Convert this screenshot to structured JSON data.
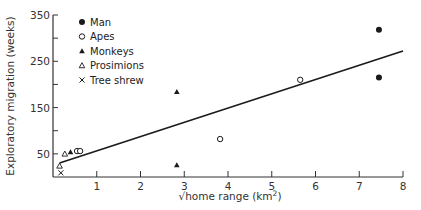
{
  "chart_data": {
    "type": "scatter",
    "title": "",
    "xlabel": "√home range (km²)",
    "xlabel_main": "√home range (km",
    "xlabel_sup": "2",
    "xlabel_end": ")",
    "ylabel": "Exploratory migration (weeks)",
    "xlim": [
      0,
      8
    ],
    "ylim": [
      0,
      350
    ],
    "x_ticks": [
      1,
      2,
      3,
      4,
      5,
      6,
      7,
      8
    ],
    "y_ticks": [
      50,
      150,
      250,
      350
    ],
    "y_minor_ticks": [
      100,
      200,
      300
    ],
    "grid": false,
    "legend_position": "upper-left",
    "series": [
      {
        "name": "Man",
        "marker": "filled-circle",
        "points": [
          [
            7.45,
            318
          ],
          [
            7.45,
            215
          ]
        ]
      },
      {
        "name": "Apes",
        "marker": "open-circle",
        "points": [
          [
            5.65,
            210
          ],
          [
            3.82,
            82
          ],
          [
            0.55,
            56
          ],
          [
            0.62,
            56
          ]
        ]
      },
      {
        "name": "Monkeys",
        "marker": "filled-triangle",
        "points": [
          [
            2.83,
            184
          ],
          [
            2.83,
            26
          ],
          [
            0.4,
            54
          ]
        ]
      },
      {
        "name": "Prosimions",
        "marker": "open-triangle",
        "points": [
          [
            0.27,
            50
          ],
          [
            0.15,
            24
          ]
        ]
      },
      {
        "name": "Tree shrew",
        "marker": "x",
        "points": [
          [
            0.18,
            9
          ]
        ]
      }
    ],
    "regression_line": {
      "x": [
        0.15,
        8.0
      ],
      "y": [
        30,
        272
      ]
    }
  },
  "legend": [
    {
      "label": "Man",
      "marker": "filled-circle"
    },
    {
      "label": "Apes",
      "marker": "open-circle"
    },
    {
      "label": "Monkeys",
      "marker": "filled-triangle"
    },
    {
      "label": "Prosimions",
      "marker": "open-triangle"
    },
    {
      "label": "Tree shrew",
      "marker": "x"
    }
  ],
  "colors": {
    "ink": "#1a1a1a",
    "axis": "#333333",
    "background": "#ffffff"
  }
}
